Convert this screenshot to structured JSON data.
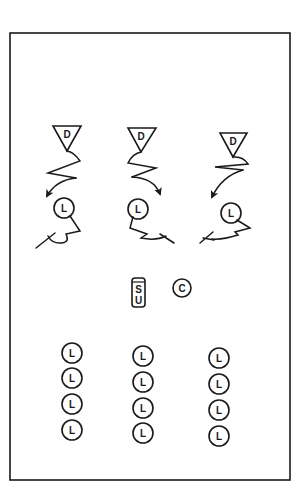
{
  "diagram": {
    "type": "play-diagram",
    "field_border": {
      "x": 10,
      "y": 33,
      "width": 280,
      "height": 447
    },
    "colors": {
      "stroke": "#1a1a1a",
      "background": "#ffffff"
    },
    "defenders": [
      {
        "label": "D",
        "apex": [
          67,
          151
        ],
        "top_y": 126,
        "half_width": 14
      },
      {
        "label": "D",
        "apex": [
          141,
          152
        ],
        "top_y": 128,
        "half_width": 14
      },
      {
        "label": "D",
        "apex": [
          233,
          157
        ],
        "top_y": 133,
        "half_width": 14
      }
    ],
    "front_players": [
      {
        "label": "L",
        "center": [
          64,
          208
        ],
        "r": 10
      },
      {
        "label": "L",
        "center": [
          138,
          209
        ],
        "r": 10
      },
      {
        "label": "L",
        "center": [
          231,
          213
        ],
        "r": 10
      }
    ],
    "setup_player": {
      "label_top": "S",
      "label_bottom": "U",
      "x": 132,
      "y": 278,
      "width": 13,
      "height": 29
    },
    "coach": {
      "label": "C",
      "center": [
        182,
        288
      ],
      "r": 9
    },
    "line_columns": [
      {
        "label": "L",
        "x": 72,
        "ys": [
          353,
          378,
          404,
          430
        ],
        "r": 10
      },
      {
        "label": "L",
        "x": 143,
        "ys": [
          356,
          382,
          408,
          433
        ],
        "r": 10
      },
      {
        "label": "L",
        "x": 219,
        "ys": [
          358,
          384,
          410,
          436
        ],
        "r": 10
      }
    ]
  }
}
